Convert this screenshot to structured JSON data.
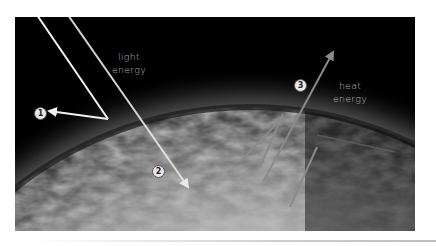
{
  "diagram": {
    "labels": {
      "light_energy_line1": "light",
      "light_energy_line2": "energy",
      "heat_energy_line1": "heat",
      "heat_energy_line2": "energy"
    },
    "markers": [
      {
        "id": 1,
        "text": "1",
        "meaning": "reflected light"
      },
      {
        "id": 2,
        "text": "2",
        "meaning": "light absorbed by surface"
      },
      {
        "id": 3,
        "text": "3",
        "meaning": "heat radiated back"
      }
    ],
    "colors": {
      "space": "#000000",
      "light_arrow": "#f2f2f2",
      "heat_arrow": "#8a8a8a",
      "atmosphere_glow": "#9a9a9a",
      "label_text": "#bdbdbd"
    }
  }
}
